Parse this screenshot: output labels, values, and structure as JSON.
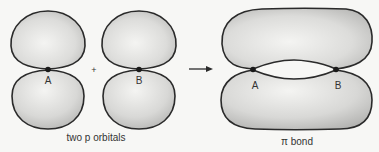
{
  "diagram": {
    "left_group": {
      "caption": "two p orbitals",
      "orbital_a": {
        "nucleus_label": "A"
      },
      "orbital_b": {
        "nucleus_label": "B"
      },
      "operator": "+"
    },
    "arrow": {
      "direction": "right"
    },
    "right_group": {
      "caption": "π bond",
      "nucleus_a_label": "A",
      "nucleus_b_label": "B"
    },
    "colors": {
      "background": "#f7f7f5",
      "lobe_fill_light": "#f2f2f0",
      "lobe_fill_dark": "#bdbdbb",
      "outline": "#2a2a2a",
      "nucleus": "#1a1a1a"
    }
  }
}
